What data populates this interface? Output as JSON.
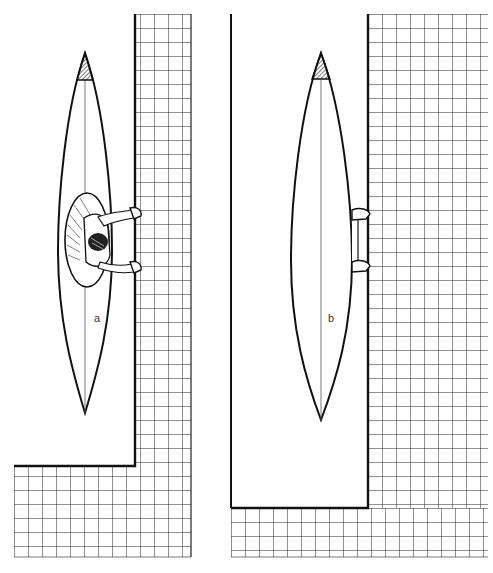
{
  "figure": {
    "panels": [
      {
        "id": "a",
        "label": "a",
        "shows": "kayak with paddler seated in cockpit, both hands on pool edge"
      },
      {
        "id": "b",
        "label": "b",
        "shows": "kayak viewed with cockpit hidden, hands gripping pool edge"
      }
    ]
  },
  "colors": {
    "background": "#ffffff",
    "ink": "#111111",
    "grid": "#222222",
    "bow_shade": "#777777"
  }
}
